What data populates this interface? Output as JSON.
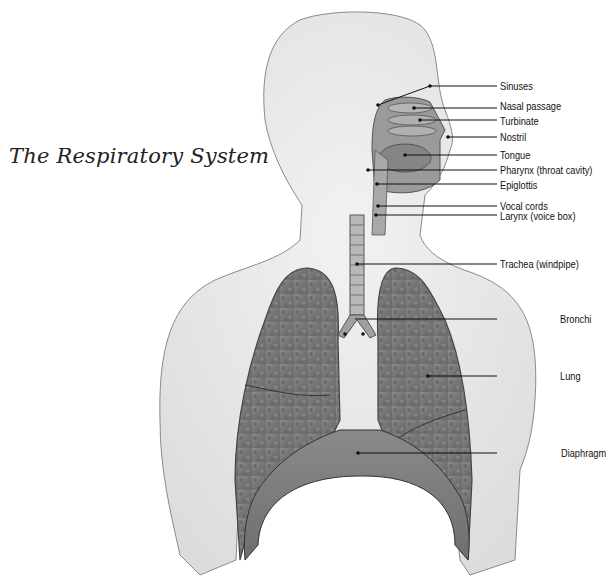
{
  "title": "The Respiratory System",
  "labels": [
    {
      "id": "sinuses",
      "text": "Sinuses",
      "y": 86
    },
    {
      "id": "nasal-passage",
      "text": "Nasal passage",
      "y": 106
    },
    {
      "id": "turbinate",
      "text": "Turbinate",
      "y": 121
    },
    {
      "id": "nostril",
      "text": "Nostril",
      "y": 137
    },
    {
      "id": "tongue",
      "text": "Tongue",
      "y": 155
    },
    {
      "id": "pharynx",
      "text": "Pharynx (throat cavity)",
      "y": 170
    },
    {
      "id": "epiglottis",
      "text": "Epiglottis",
      "y": 185
    },
    {
      "id": "vocal-cords",
      "text": "Vocal cords",
      "y": 206
    },
    {
      "id": "larynx",
      "text": "Larynx (voice box)",
      "y": 216
    },
    {
      "id": "trachea",
      "text": "Trachea (windpipe)",
      "y": 264
    },
    {
      "id": "bronchi",
      "text": "Bronchi",
      "y": 319
    },
    {
      "id": "lung",
      "text": "Lung",
      "y": 376
    },
    {
      "id": "diaphragm",
      "text": "Diaphragm",
      "y": 453
    }
  ]
}
